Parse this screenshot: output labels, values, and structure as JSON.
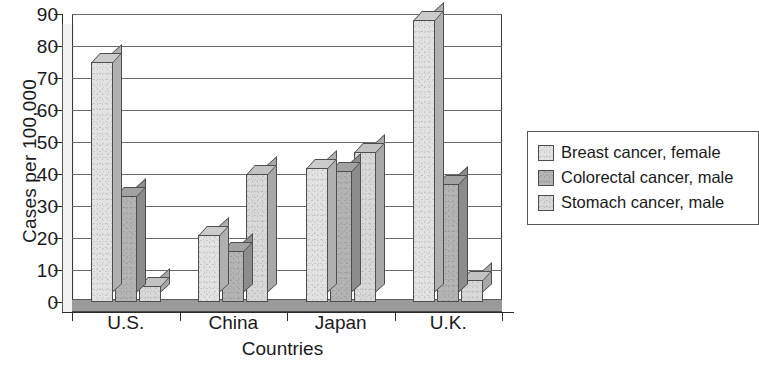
{
  "chart_data": {
    "type": "bar",
    "title": "",
    "xlabel": "Countries",
    "ylabel": "Cases per 100,000",
    "categories": [
      "U.S.",
      "China",
      "Japan",
      "U.K."
    ],
    "series": [
      {
        "name": "Breast cancer, female",
        "values": [
          75,
          21,
          42,
          88
        ],
        "color": "#e2e2e2"
      },
      {
        "name": "Colorectal cancer, male",
        "values": [
          33,
          16,
          41,
          37
        ],
        "color": "#b4b4b4"
      },
      {
        "name": "Stomach cancer, male",
        "values": [
          5,
          40,
          47,
          7
        ],
        "color": "#d8d8d8"
      }
    ],
    "ylim": [
      0,
      90
    ],
    "yticks": [
      0,
      10,
      20,
      30,
      40,
      50,
      60,
      70,
      80,
      90
    ],
    "ytick_labels": [
      "0",
      "10",
      "20",
      "30",
      "40",
      "50",
      "60",
      "70",
      "80",
      "90"
    ],
    "grid": true,
    "legend_position": "right",
    "style": "3d-bar",
    "axis_color": "#2a2a2a",
    "grid_color": "#6b6b6b",
    "plot_background": "#ffffff"
  },
  "legend": {
    "entries": [
      {
        "label": "Breast cancer, female"
      },
      {
        "label": "Colorectal cancer, male"
      },
      {
        "label": "Stomach cancer, male"
      }
    ]
  }
}
